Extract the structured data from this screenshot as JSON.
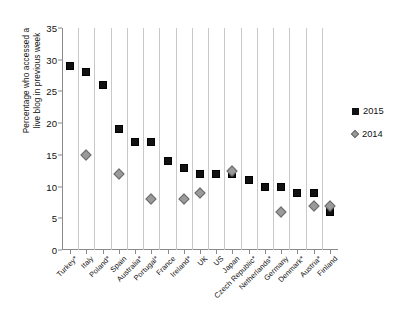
{
  "chart_data": {
    "type": "scatter",
    "title": "",
    "xlabel": "",
    "ylabel": "Percentage who accessed a live blog in previous week",
    "ylabel_line1": "Percentage who accessed a",
    "ylabel_line2": "live blog in previous week",
    "ylim": [
      0,
      35
    ],
    "yticks": [
      0,
      5,
      10,
      15,
      20,
      25,
      30,
      35
    ],
    "grid": "vertical",
    "legend_position": "right",
    "categories": [
      "Turkey*",
      "Italy",
      "Poland*",
      "Spain",
      "Australia*",
      "Portugal*",
      "France",
      "Ireland*",
      "UK",
      "US",
      "Japan",
      "Czech Republic*",
      "Netherlands*",
      "Germany",
      "Denmark*",
      "Austria*",
      "Finland"
    ],
    "series": [
      {
        "name": "2015",
        "marker": "square",
        "color": "#111111",
        "values": [
          29,
          28,
          26,
          19,
          17,
          17,
          14,
          13,
          12,
          12,
          12,
          11,
          10,
          10,
          9,
          9,
          6
        ]
      },
      {
        "name": "2014",
        "marker": "diamond",
        "color": "#9a9a9a",
        "values": [
          null,
          15,
          null,
          12,
          null,
          8,
          null,
          8,
          9,
          null,
          12.5,
          null,
          null,
          6,
          null,
          7,
          7
        ]
      }
    ]
  },
  "legend": {
    "entries": [
      {
        "label": "2015",
        "marker": "square"
      },
      {
        "label": "2014",
        "marker": "diamond"
      }
    ]
  },
  "colors": {
    "series_2015": "#111111",
    "series_2014": "#9a9a9a",
    "gridline": "#c9c9c9",
    "axis": "#8a8a8a",
    "background": "#ffffff"
  }
}
